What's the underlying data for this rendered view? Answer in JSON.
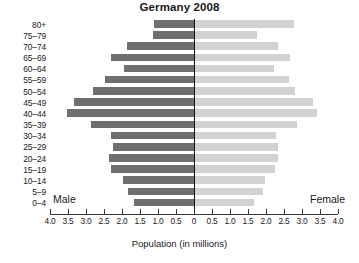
{
  "chart_data": {
    "type": "bar",
    "subtype": "population-pyramid",
    "title": "Germany 2008",
    "xlabel": "Population (in millions)",
    "ylabel": "",
    "categories": [
      "0–4",
      "5–9",
      "10–14",
      "15–19",
      "20–24",
      "25–29",
      "30–34",
      "35–39",
      "40–44",
      "45–49",
      "50–54",
      "55–59",
      "60–64",
      "65–69",
      "70–74",
      "75–79",
      "80+"
    ],
    "series": [
      {
        "name": "Male",
        "color": "#6f6f6f",
        "direction": "left",
        "values": [
          1.67,
          1.83,
          1.97,
          2.3,
          2.36,
          2.25,
          2.31,
          2.86,
          3.52,
          3.33,
          2.8,
          2.47,
          1.94,
          2.31,
          1.86,
          1.14,
          1.11
        ]
      },
      {
        "name": "Female",
        "color": "#d2d2d2",
        "direction": "right",
        "values": [
          1.64,
          1.89,
          1.94,
          2.22,
          2.31,
          2.31,
          2.25,
          2.83,
          3.39,
          3.28,
          2.78,
          2.61,
          2.19,
          2.64,
          2.31,
          1.72,
          2.75
        ]
      }
    ],
    "xlim": [
      -4.0,
      4.0
    ],
    "xticks": [
      4.0,
      3.5,
      3.0,
      2.5,
      2.0,
      1.5,
      1.0,
      0.5,
      0,
      0.5,
      1.0,
      1.5,
      2.0,
      2.5,
      3.0,
      3.5,
      4.0
    ],
    "xticklabels": [
      "4.0",
      "3.5",
      "3.0",
      "2.5",
      "2.0",
      "1.5",
      "1.0",
      "0.5",
      "0",
      "0.5",
      "1.0",
      "1.5",
      "2.0",
      "2.5",
      "3.0",
      "3.5",
      "4.0"
    ],
    "grid": false,
    "legend": {
      "position": "inside-bottom",
      "entries": [
        "Male",
        "Female"
      ]
    },
    "annotations": [
      {
        "text": "Male",
        "position": "bottom-left"
      },
      {
        "text": "Female",
        "position": "bottom-right"
      }
    ]
  },
  "labels": {
    "male": "Male",
    "female": "Female"
  },
  "colors": {
    "male_bar": "#6f6f6f",
    "female_bar": "#d2d2d2",
    "axis": "#3a3a3a",
    "zero_line": "#111111",
    "background": "#ffffff",
    "text": "#1a1a1a"
  }
}
